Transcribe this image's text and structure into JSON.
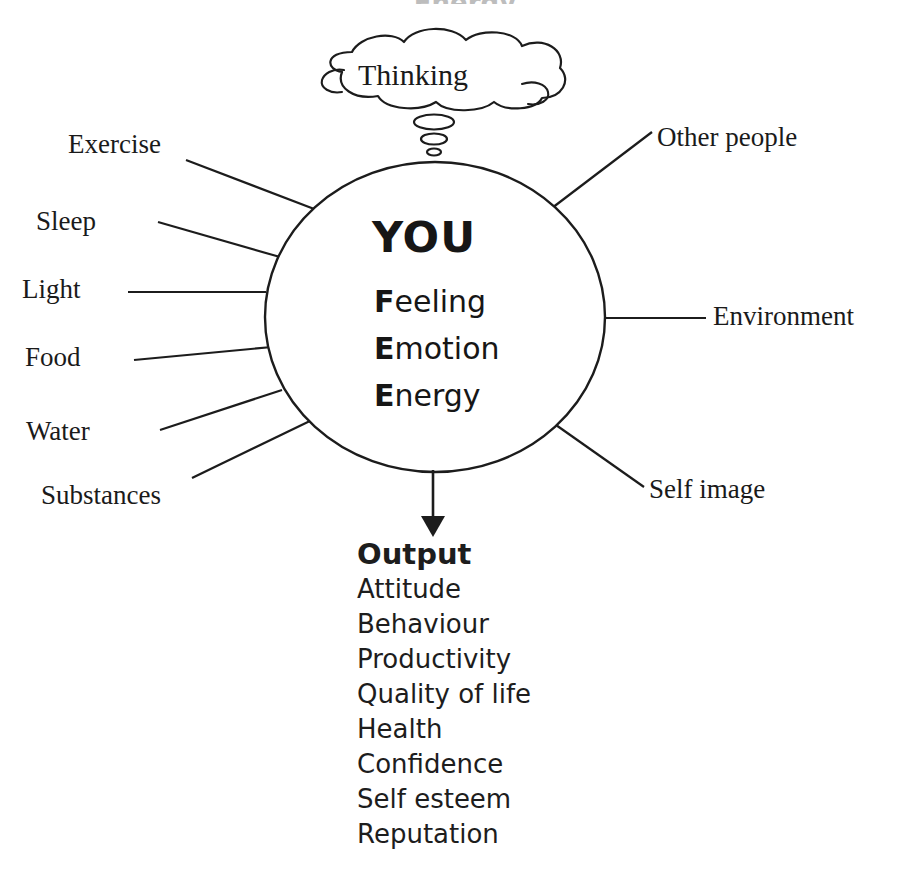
{
  "diagram": {
    "title_clipped": "Energy",
    "thought_bubble": {
      "label": "Thinking"
    },
    "core": {
      "title": "YOU",
      "items": [
        {
          "initial": "F",
          "rest": "eeling"
        },
        {
          "initial": "E",
          "rest": "motion"
        },
        {
          "initial": "E",
          "rest": "nergy"
        }
      ]
    },
    "inputs_left": [
      {
        "label": "Exercise"
      },
      {
        "label": "Sleep"
      },
      {
        "label": "Light"
      },
      {
        "label": "Food"
      },
      {
        "label": "Water"
      },
      {
        "label": "Substances"
      }
    ],
    "inputs_right": [
      {
        "label": "Other people"
      },
      {
        "label": "Environment"
      },
      {
        "label": "Self image"
      }
    ],
    "output": {
      "title": "Output",
      "items": [
        "Attitude",
        "Behaviour",
        "Productivity",
        "Quality of life",
        "Health",
        "Confidence",
        "Self esteem",
        "Reputation"
      ]
    },
    "colors": {
      "ink": "#1c1c1c",
      "background": "#ffffff"
    }
  }
}
